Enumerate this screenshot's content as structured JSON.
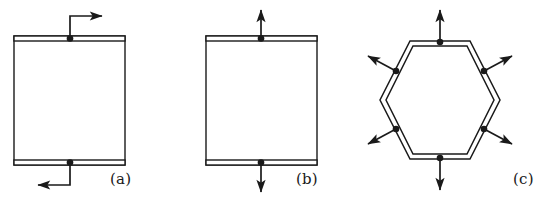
{
  "figure": {
    "title": "",
    "background_color": "#ffffff",
    "stroke_color": "#1a1a1a",
    "width": 557,
    "height": 201
  },
  "panels": [
    {
      "id": "a",
      "label": "(a)",
      "shape": "square-cell",
      "description": "Square unit cell with thin horizontal bands on top and bottom edges; a node dot on the middle of the top band with an arrow going up then turning right, and a node dot on the middle of the bottom band with an arrow going down then turning left (shear / antisymmetric loading).",
      "box": {
        "x": 14,
        "y": 36,
        "width": 111,
        "height": 129
      },
      "band_thickness": 5,
      "nodes": [
        {
          "name": "top-node",
          "x": 70,
          "y": 38,
          "arrow": "up-then-right"
        },
        {
          "name": "bottom-node",
          "x": 70,
          "y": 163,
          "arrow": "down-then-left"
        }
      ]
    },
    {
      "id": "b",
      "label": "(b)",
      "shape": "square-cell",
      "description": "Square unit cell with thin horizontal bands on top and bottom edges; a node dot on the middle of the top band with a straight arrow pointing up, and a node dot on the middle of the bottom band with a straight arrow pointing down (symmetric tension loading).",
      "box": {
        "x": 206,
        "y": 36,
        "width": 111,
        "height": 129
      },
      "band_thickness": 5,
      "nodes": [
        {
          "name": "top-node",
          "x": 261,
          "y": 38,
          "arrow": "up"
        },
        {
          "name": "bottom-node",
          "x": 261,
          "y": 163,
          "arrow": "down"
        }
      ]
    },
    {
      "id": "c",
      "label": "(c)",
      "shape": "hexagon-cell",
      "description": "Flat-top hexagon drawn as a double outline with node dots at the midpoint of every one of its six edges, each carrying an arrow pointing radially outward from the hexagon centre.",
      "center": {
        "x": 440,
        "y": 100
      },
      "radius": 60,
      "edge_count": 6,
      "nodes": [
        {
          "name": "top-node",
          "arrow": "up"
        },
        {
          "name": "upper-right-node",
          "arrow": "upper-right"
        },
        {
          "name": "lower-right-node",
          "arrow": "lower-right"
        },
        {
          "name": "bottom-node",
          "arrow": "down"
        },
        {
          "name": "lower-left-node",
          "arrow": "lower-left"
        },
        {
          "name": "upper-left-node",
          "arrow": "upper-left"
        }
      ]
    }
  ]
}
